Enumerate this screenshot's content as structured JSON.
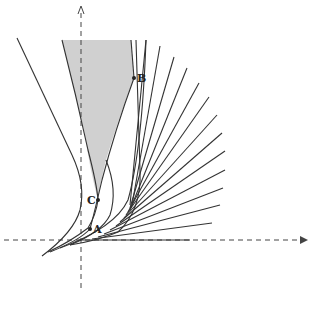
{
  "diagram": {
    "type": "geometric-figure",
    "colors": {
      "stroke": "#333333",
      "shade": "#cfcfcf",
      "background": "#ffffff",
      "axis": "#444444"
    },
    "axes": {
      "horizontal": {
        "style": "dashed",
        "arrow": "right"
      },
      "vertical": {
        "style": "dashed",
        "arrow": "up"
      }
    },
    "points": [
      {
        "label": "A",
        "x": 90,
        "y": 229
      },
      {
        "label": "B",
        "x": 134,
        "y": 78
      },
      {
        "label": "C",
        "x": 98,
        "y": 200
      }
    ],
    "shaded_region": "grey wedge between two curves above point C",
    "fan_line_count": 15
  }
}
